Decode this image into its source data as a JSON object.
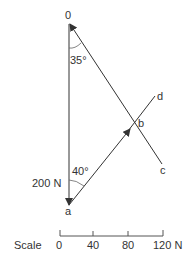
{
  "diagram": {
    "points": {
      "o": "0",
      "a": "a",
      "b": "b",
      "c": "c",
      "d": "d"
    },
    "angles": {
      "top": "35°",
      "bottom": "40°"
    },
    "force": "200 N",
    "scale": {
      "label": "Scale",
      "ticks": [
        "0",
        "40",
        "80",
        "120 N"
      ]
    }
  }
}
